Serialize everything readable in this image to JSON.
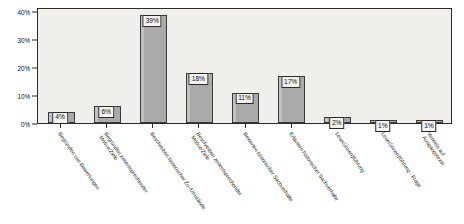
{
  "chart_data": {
    "type": "bar",
    "title": "",
    "subtitle": "",
    "xlabel": "",
    "ylabel": "",
    "ylim": [
      0,
      42
    ],
    "grid": false,
    "legend": null,
    "y_ticks": [
      "0%",
      "10%",
      "20%",
      "30%",
      "40%"
    ],
    "y_tick_values": [
      0,
      10,
      20,
      30,
      40
    ],
    "categories": [
      "Begründen von Bewertungen",
      "Begründen zeitentsprechender Motive/Ziele",
      "Beschreiben historischer Zu-/Umstände",
      "Beschreiben zeitentsprechender Motive/Ziele",
      "Bewerten historischer Sachverhalte",
      "Erläutern historischer Sachverhalte",
      "Leser(innen)führung",
      "Leser(innen)führung - Frage",
      "Verweis auf Ausgangstexte"
    ],
    "category_lines": [
      [
        "Begründen von Bewertungen",
        ""
      ],
      [
        "Begründen zeitentsprechender",
        "Motive/Ziele"
      ],
      [
        "Beschreiben historischer Zu-/Umstände",
        ""
      ],
      [
        "Beschreiben zeitentsprechender",
        "Motive/Ziele"
      ],
      [
        "Bewerten historischer Sachverhalte",
        ""
      ],
      [
        "Erläutern historischer Sachverhalte",
        ""
      ],
      [
        "Leser(innen)führung",
        ""
      ],
      [
        "Leser(innen)führung - Frage",
        ""
      ],
      [
        "Verweis auf",
        "Ausgangstexte"
      ]
    ],
    "values": [
      4,
      6,
      39,
      18,
      11,
      17,
      2,
      1,
      1
    ],
    "value_labels": [
      "4%",
      "6%",
      "39%",
      "18%",
      "11%",
      "17%",
      "2%",
      "1%",
      "1%"
    ],
    "colors": {
      "bar_fill": "#aaaaaa",
      "bar_border": "#3a3a3a",
      "plot_background": "#f0efec",
      "axis": "#2b2b2b",
      "label_background": "#f4f3f0",
      "text": "#111111"
    }
  }
}
